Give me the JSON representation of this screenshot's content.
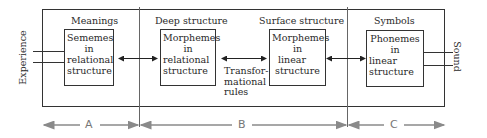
{
  "diagram": {
    "sections": [
      {
        "header": "Meanings",
        "box_lines": [
          "Sememes",
          "in",
          "relational",
          "structure"
        ]
      },
      {
        "header": "Deep structure",
        "box_lines": [
          "Morphemes",
          "in",
          "relational",
          "structure"
        ]
      },
      {
        "header": "Surface structure",
        "box_lines": [
          "Morphemes",
          "in",
          "linear",
          "structure"
        ]
      },
      {
        "header": "Symbols",
        "box_lines": [
          "Phonemes",
          "in",
          "linear",
          "structure"
        ]
      }
    ],
    "transform_label": [
      "Transfor-",
      "mational",
      "rules"
    ],
    "left_input": "Experience",
    "right_output": "Sound",
    "zones": [
      {
        "label": "A"
      },
      {
        "label": "B"
      },
      {
        "label": "C"
      }
    ],
    "colors": {
      "line": "#333333",
      "zone_arrow": "#8a8a8a",
      "background": "#ffffff"
    }
  }
}
